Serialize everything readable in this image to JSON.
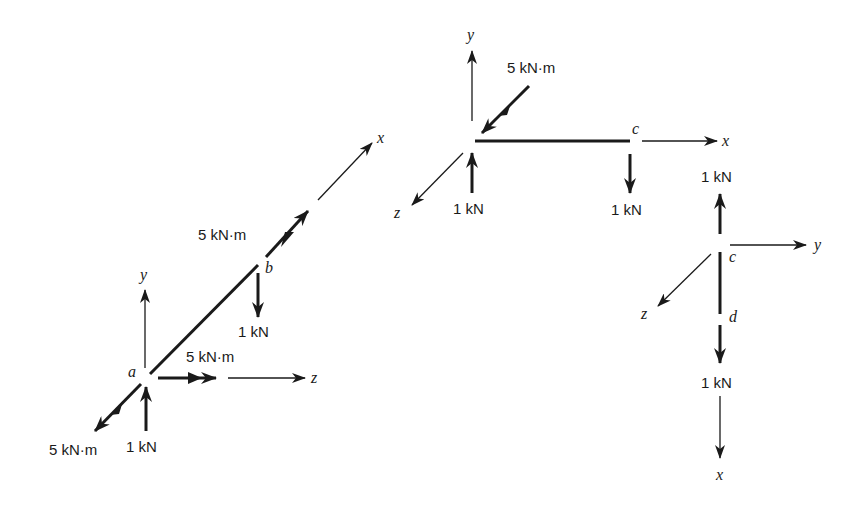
{
  "diagram": {
    "type": "free-body diagrams of 3D frame members",
    "colors": {
      "ink": "#1a1a1a",
      "background": "#ffffff"
    },
    "member_ab": {
      "axes": {
        "x": "x",
        "y": "y",
        "z": "z"
      },
      "points": {
        "a": "a",
        "b": "b"
      },
      "loads": {
        "a_moment_out": "5 kN·m",
        "a_force_up": "1 kN",
        "a_moment_z": "5 kN·m",
        "b_moment_x": "5 kN·m",
        "b_force_down": "1 kN"
      }
    },
    "member_bc": {
      "axes": {
        "x": "x",
        "y": "y",
        "z": "z"
      },
      "points": {
        "c": "c"
      },
      "loads": {
        "moment_diag": "5 kN·m",
        "left_force_up": "1 kN",
        "c_force_down": "1 kN"
      }
    },
    "member_cd": {
      "axes": {
        "x": "x",
        "y": "y",
        "z": "z"
      },
      "points": {
        "c": "c",
        "d": "d"
      },
      "loads": {
        "c_force_up": "1 kN",
        "d_force_down": "1 kN"
      }
    }
  }
}
